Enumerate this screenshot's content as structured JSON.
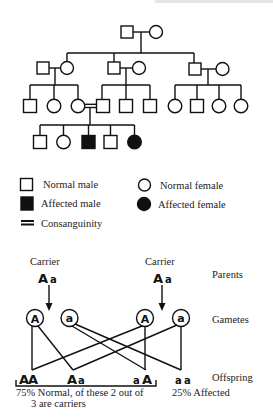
{
  "pedigree": {
    "generations": [
      {
        "id": "gen1",
        "members": [
          {
            "id": "g1-m",
            "sex": "male",
            "status": "normal"
          },
          {
            "id": "g1-f",
            "sex": "female",
            "status": "normal"
          }
        ]
      },
      {
        "id": "gen2",
        "couples": [
          {
            "id": "couple-left",
            "members": [
              {
                "sex": "male",
                "status": "normal"
              },
              {
                "sex": "female",
                "status": "normal"
              }
            ]
          },
          {
            "id": "couple-middle",
            "members": [
              {
                "sex": "male",
                "status": "normal"
              },
              {
                "sex": "female",
                "status": "normal"
              }
            ]
          },
          {
            "id": "couple-right",
            "members": [
              {
                "sex": "male",
                "status": "normal"
              },
              {
                "sex": "female",
                "status": "normal"
              }
            ]
          }
        ]
      },
      {
        "id": "gen3",
        "sibships": [
          {
            "parents": "couple-left",
            "children": [
              {
                "sex": "male",
                "status": "normal"
              },
              {
                "sex": "female",
                "status": "normal"
              },
              {
                "sex": "female",
                "status": "normal"
              }
            ]
          },
          {
            "parents": "couple-middle",
            "children": [
              {
                "sex": "male",
                "status": "normal"
              },
              {
                "sex": "male",
                "status": "normal"
              },
              {
                "sex": "male",
                "status": "normal"
              }
            ]
          },
          {
            "parents": "couple-right",
            "children": [
              {
                "sex": "female",
                "status": "normal"
              },
              {
                "sex": "male",
                "status": "normal"
              },
              {
                "sex": "female",
                "status": "normal"
              },
              {
                "sex": "female",
                "status": "normal"
              }
            ]
          }
        ],
        "consanguineous_union": "third child of left sibship x first child of middle sibship"
      },
      {
        "id": "gen4",
        "children": [
          {
            "sex": "male",
            "status": "normal"
          },
          {
            "sex": "female",
            "status": "normal"
          },
          {
            "sex": "male",
            "status": "affected"
          },
          {
            "sex": "male",
            "status": "normal"
          },
          {
            "sex": "female",
            "status": "affected"
          }
        ]
      }
    ]
  },
  "legend": {
    "normal_male": "Normal male",
    "affected_male": "Affected male",
    "consanguinity": "Consanguinity",
    "normal_female": "Normal female",
    "affected_female": "Affected female"
  },
  "cross": {
    "parents": [
      {
        "label": "Carrier",
        "allele1": "A",
        "allele2": "a"
      },
      {
        "label": "Carrier",
        "allele1": "A",
        "allele2": "a"
      }
    ],
    "gametes": [
      "A",
      "a",
      "A",
      "a"
    ],
    "offspring": [
      {
        "allele1": "A",
        "allele2": "A"
      },
      {
        "allele1": "A",
        "allele2": "a"
      },
      {
        "allele1": "a",
        "allele2": "A"
      },
      {
        "allele1": "a",
        "allele2": "a"
      }
    ],
    "row_labels": {
      "parents": "Parents",
      "gametes": "Gametes",
      "offspring": "Offspring"
    },
    "summary": {
      "normal_line1": "75% Normal,  of these 2 out of",
      "normal_line2": "3 are carriers",
      "affected": "25% Affected"
    }
  }
}
